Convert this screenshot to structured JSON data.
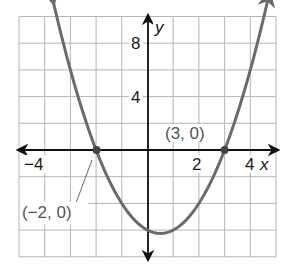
{
  "chart_data": {
    "type": "line",
    "title": "",
    "function": "y = (x + 2)(x - 3)",
    "xlabel": "x",
    "ylabel": "y",
    "xlim": [
      -5,
      5
    ],
    "ylim": [
      -8,
      10
    ],
    "grid": true,
    "grid_step": {
      "x": 1,
      "y": 2
    },
    "x_ticks": [
      {
        "value": -4,
        "label": "−4"
      },
      {
        "value": 2,
        "label": "2"
      },
      {
        "value": 4,
        "label": "4"
      }
    ],
    "y_ticks": [
      {
        "value": 8,
        "label": "8"
      },
      {
        "value": 4,
        "label": "4"
      }
    ],
    "series": [
      {
        "name": "parabola",
        "color": "#6b6b6b",
        "x": [
          -3.7,
          -3,
          -2,
          -1,
          0,
          0.5,
          1,
          2,
          3,
          4,
          4.7
        ],
        "y": [
          10.39,
          6,
          0,
          -4,
          -6,
          -6.25,
          -6,
          -4,
          0,
          6,
          10.39
        ]
      }
    ],
    "points": [
      {
        "x": -2,
        "y": 0,
        "label": "(−2, 0)"
      },
      {
        "x": 3,
        "y": 0,
        "label": "(3, 0)"
      }
    ],
    "annotations": [
      "(−2, 0)",
      "(3, 0)"
    ]
  },
  "labels": {
    "x_axis": "x",
    "y_axis": "y",
    "tick_neg4": "−4",
    "tick_2": "2",
    "tick_4": "4",
    "tick_8": "8",
    "tick_y4": "4",
    "point_left": "(−2, 0)",
    "point_right": "(3, 0)"
  },
  "colors": {
    "grid": "#b5b5b5",
    "axis": "#111111",
    "curve": "#6b6b6b",
    "annotation": "#555555"
  }
}
